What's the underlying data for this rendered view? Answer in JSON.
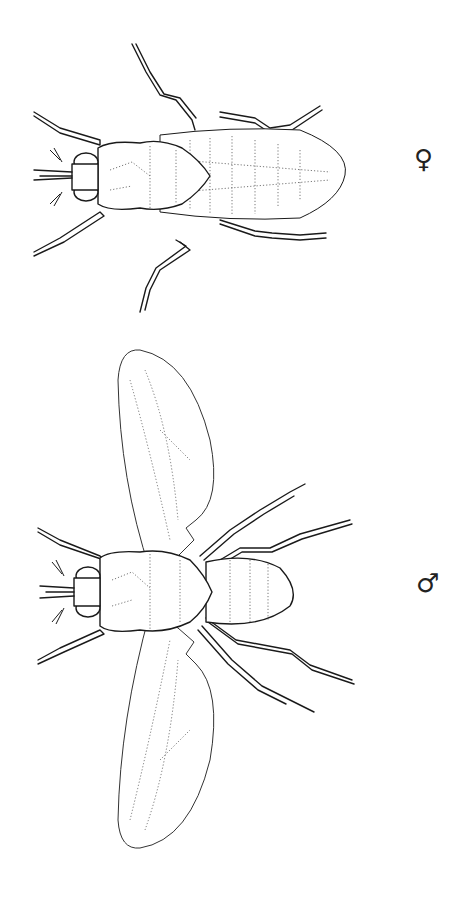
{
  "figure": {
    "specimens": [
      {
        "id": "female",
        "label": "♀",
        "description": "Wingless female fly, dorsal view"
      },
      {
        "id": "male",
        "label": "♂",
        "description": "Winged male fly, dorsal view"
      }
    ]
  },
  "labels": {
    "female_symbol": "♀",
    "male_symbol": "♂"
  }
}
